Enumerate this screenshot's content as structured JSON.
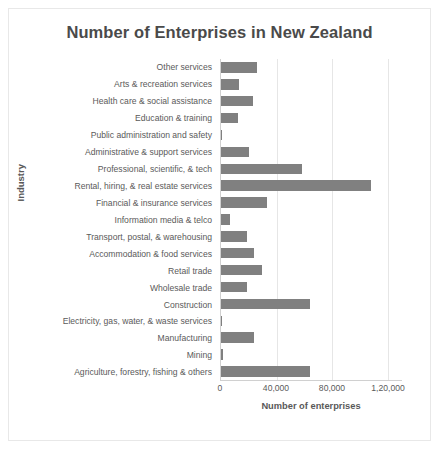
{
  "chart_data": {
    "type": "bar",
    "orientation": "horizontal",
    "title": "Number of Enterprises in New Zealand",
    "xlabel": "Number of enterprises",
    "ylabel": "Industry",
    "xlim": [
      0,
      130000
    ],
    "xticks": [
      0,
      40000,
      80000,
      120000
    ],
    "xtick_labels": [
      "0",
      "40,000",
      "80,000",
      "1,20,000"
    ],
    "grid": "vertical",
    "legend": "none",
    "bar_color": "#808080",
    "categories": [
      "Other services",
      "Arts & recreation services",
      "Health care & social assistance",
      "Education & training",
      "Public administration and safety",
      "Administrative & support services",
      "Professional, scientific, & tech",
      "Rental, hiring, & real estate services",
      "Financial & insurance services",
      "Information media & telco",
      "Transport, postal, & warehousing",
      "Accommodation & food services",
      "Retail trade",
      "Wholesale trade",
      "Construction",
      "Electricity, gas, water, & waste services",
      "Manufacturing",
      "Mining",
      "Agriculture, forestry, fishing & others"
    ],
    "values": [
      25500,
      13000,
      23000,
      12500,
      900,
      20000,
      58000,
      108000,
      33000,
      6500,
      18500,
      23500,
      29500,
      18500,
      64000,
      1000,
      24000,
      1200,
      64000
    ]
  }
}
